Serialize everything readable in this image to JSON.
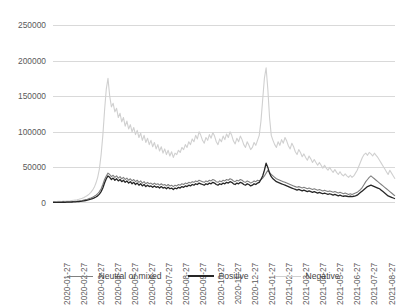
{
  "chart_data": {
    "type": "line",
    "title": "",
    "xlabel": "",
    "ylabel": "",
    "ylim": [
      0,
      250000
    ],
    "ytick_labels": [
      "0",
      "50000",
      "100000",
      "150000",
      "200000",
      "250000"
    ],
    "ytick_values": [
      0,
      50000,
      100000,
      150000,
      200000,
      250000
    ],
    "grid": true,
    "legend_position": "bottom",
    "x_tick_labels": [
      "2020-01-27",
      "2020-02-27",
      "2020-03-27",
      "2020-04-27",
      "2020-05-27",
      "2020-06-27",
      "2020-07-27",
      "2020-08-27",
      "2020-09-27",
      "2020-10-27",
      "2020-11-27",
      "2020-12-27",
      "2021-01-27",
      "2021-02-27",
      "2021-03-27",
      "2021-04-27",
      "2021-05-27",
      "2021-06-27",
      "2021-07-27",
      "2021-08-27"
    ],
    "x_start": "2020-01-27",
    "x_end": "2021-08-27",
    "series": [
      {
        "name": "Neutral or mixed",
        "color": "#808080",
        "values": [
          1200,
          1300,
          1100,
          1500,
          1400,
          1300,
          1600,
          1500,
          1700,
          1600,
          1800,
          2000,
          2200,
          2400,
          2600,
          2900,
          3200,
          3600,
          4200,
          4800,
          5400,
          6200,
          7000,
          8200,
          9500,
          11000,
          13000,
          16000,
          20000,
          26000,
          33000,
          38000,
          42000,
          40000,
          37000,
          39000,
          36000,
          38000,
          35000,
          37000,
          34000,
          36000,
          33000,
          35000,
          32000,
          34000,
          31000,
          33000,
          30000,
          32000,
          29000,
          31000,
          28000,
          30000,
          27000,
          29000,
          27000,
          28000,
          26000,
          28000,
          26000,
          27000,
          25000,
          27000,
          25000,
          26000,
          24000,
          26000,
          24000,
          25000,
          23000,
          25000,
          24000,
          26000,
          25000,
          27000,
          26000,
          28000,
          27000,
          29000,
          28000,
          30000,
          29000,
          31000,
          30000,
          32000,
          31000,
          30000,
          29000,
          31000,
          30000,
          32000,
          31000,
          33000,
          32000,
          30000,
          29000,
          31000,
          30000,
          32000,
          31000,
          33000,
          32000,
          34000,
          33000,
          31000,
          30000,
          32000,
          31000,
          33000,
          32000,
          30000,
          29000,
          31000,
          30000,
          28000,
          29000,
          31000,
          30000,
          32000,
          31000,
          33000,
          35000,
          38000,
          42000,
          46000,
          43000,
          40000,
          38000,
          36000,
          34000,
          33000,
          32000,
          31000,
          30000,
          29000,
          28000,
          27000,
          26000,
          25000,
          24000,
          23000,
          22000,
          23000,
          22000,
          21000,
          22000,
          21000,
          20000,
          21000,
          20000,
          19000,
          20000,
          19000,
          18000,
          19000,
          18000,
          17000,
          18000,
          17000,
          16000,
          17000,
          16000,
          15000,
          16000,
          15000,
          14000,
          15000,
          14000,
          13000,
          14000,
          13000,
          12000,
          13000,
          12000,
          13000,
          14000,
          15000,
          17000,
          19000,
          22000,
          26000,
          30000,
          33000,
          36000,
          38000,
          36000,
          34000,
          32000,
          30000,
          28000,
          26000,
          24000,
          22000,
          20000,
          18000,
          16000,
          14000,
          12000,
          10000
        ]
      },
      {
        "name": "Positive",
        "color": "#262626",
        "values": [
          800,
          900,
          850,
          1000,
          950,
          900,
          1100,
          1000,
          1200,
          1100,
          1300,
          1400,
          1600,
          1700,
          1900,
          2100,
          2400,
          2700,
          3100,
          3500,
          4000,
          4600,
          5300,
          6100,
          7200,
          8500,
          10000,
          12500,
          16000,
          21000,
          28000,
          34000,
          38000,
          36000,
          33000,
          35000,
          32000,
          34000,
          31000,
          33000,
          30000,
          32000,
          29000,
          31000,
          28000,
          30000,
          27000,
          29000,
          26000,
          28000,
          25000,
          27000,
          24000,
          26000,
          23000,
          25000,
          23000,
          24000,
          22000,
          24000,
          22000,
          23000,
          21000,
          23000,
          21000,
          22000,
          20000,
          22000,
          20000,
          21000,
          19000,
          21000,
          20000,
          22000,
          21000,
          23000,
          22000,
          24000,
          23000,
          25000,
          24000,
          26000,
          25000,
          27000,
          26000,
          28000,
          27000,
          26000,
          25000,
          27000,
          26000,
          28000,
          27000,
          29000,
          28000,
          26000,
          25000,
          27000,
          26000,
          28000,
          27000,
          29000,
          28000,
          30000,
          29000,
          27000,
          26000,
          28000,
          27000,
          29000,
          28000,
          26000,
          25000,
          27000,
          26000,
          24000,
          25000,
          27000,
          26000,
          28000,
          29000,
          33000,
          38000,
          46000,
          56000,
          50000,
          42000,
          37000,
          34000,
          32000,
          30000,
          29000,
          28000,
          27000,
          26000,
          25000,
          24000,
          23000,
          22000,
          21000,
          20000,
          19000,
          18000,
          19000,
          18000,
          17000,
          18000,
          17000,
          16000,
          17000,
          16000,
          15000,
          16000,
          15000,
          14000,
          15000,
          14000,
          13000,
          14000,
          13000,
          12000,
          13000,
          12000,
          11000,
          12000,
          11000,
          10000,
          11000,
          10000,
          9500,
          10000,
          9500,
          9000,
          9500,
          9000,
          9500,
          10000,
          11000,
          13000,
          15000,
          17000,
          19000,
          21000,
          23000,
          24000,
          25000,
          24000,
          23000,
          22000,
          21000,
          20000,
          18000,
          16000,
          14000,
          12000,
          10000,
          9000,
          8000,
          7000,
          6000
        ]
      },
      {
        "name": "Negative",
        "color": "#d0d0d0",
        "values": [
          2000,
          2100,
          1900,
          2400,
          2300,
          2200,
          2600,
          2500,
          2800,
          2700,
          3000,
          3400,
          3800,
          4200,
          4600,
          5200,
          5900,
          6700,
          7800,
          9000,
          10500,
          12500,
          15000,
          18000,
          22000,
          28000,
          36000,
          48000,
          68000,
          95000,
          130000,
          160000,
          175000,
          150000,
          135000,
          140000,
          128000,
          133000,
          120000,
          126000,
          114000,
          120000,
          108000,
          115000,
          104000,
          110000,
          100000,
          106000,
          96000,
          102000,
          92000,
          98000,
          88000,
          95000,
          85000,
          91000,
          82000,
          88000,
          79000,
          85000,
          76000,
          82000,
          73000,
          79000,
          70000,
          76000,
          68000,
          74000,
          66000,
          72000,
          64000,
          70000,
          68000,
          74000,
          71000,
          78000,
          75000,
          82000,
          78000,
          86000,
          82000,
          90000,
          86000,
          95000,
          90000,
          100000,
          95000,
          88000,
          84000,
          92000,
          88000,
          96000,
          91000,
          99000,
          94000,
          86000,
          82000,
          90000,
          86000,
          94000,
          89000,
          97000,
          92000,
          100000,
          95000,
          87000,
          83000,
          91000,
          86000,
          94000,
          89000,
          82000,
          78000,
          86000,
          81000,
          75000,
          78000,
          85000,
          81000,
          88000,
          95000,
          115000,
          145000,
          175000,
          190000,
          160000,
          120000,
          95000,
          88000,
          82000,
          78000,
          86000,
          81000,
          89000,
          84000,
          92000,
          87000,
          80000,
          76000,
          84000,
          79000,
          72000,
          68000,
          75000,
          71000,
          65000,
          69000,
          64000,
          60000,
          66000,
          62000,
          57000,
          61000,
          57000,
          53000,
          57000,
          53000,
          49000,
          53000,
          49000,
          46000,
          50000,
          46000,
          43000,
          47000,
          43000,
          40000,
          44000,
          40000,
          38000,
          41000,
          38000,
          36000,
          39000,
          36000,
          38000,
          42000,
          46000,
          52000,
          58000,
          64000,
          68000,
          70000,
          67000,
          71000,
          69000,
          66000,
          70000,
          67000,
          64000,
          60000,
          56000,
          52000,
          48000,
          44000,
          40000,
          46000,
          42000,
          38000,
          34000
        ]
      }
    ]
  },
  "legend": {
    "items": [
      {
        "label": "Neutral or mixed",
        "color": "#808080"
      },
      {
        "label": "Positive",
        "color": "#262626"
      },
      {
        "label": "Negative",
        "color": "#d0d0d0"
      }
    ]
  }
}
